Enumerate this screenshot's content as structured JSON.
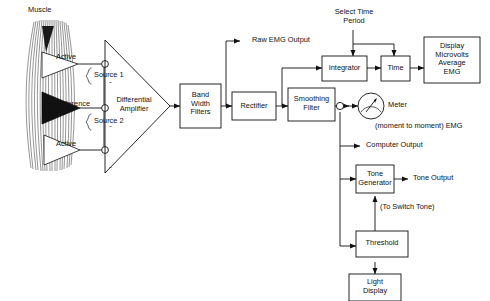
{
  "diagram": {
    "type": "block-flow-diagram",
    "background": "#ffffff",
    "line_color": "#111111"
  },
  "source": {
    "muscle_label": "Muscle",
    "electrodes": [
      {
        "id": "active-top",
        "label": "Active",
        "fill": "white"
      },
      {
        "id": "reference",
        "label": "Reference",
        "fill": "black"
      },
      {
        "id": "active-bottom",
        "label": "Active",
        "fill": "white"
      }
    ],
    "sources": [
      {
        "label": "Source 1"
      },
      {
        "label": "Source 2"
      }
    ]
  },
  "amplifier": {
    "label_line1": "Differential",
    "label_line2": "Amplifier",
    "input_signs": [
      "-",
      "-",
      "-"
    ]
  },
  "blocks": [
    {
      "id": "band-width-filters",
      "lines": [
        "Band",
        "Width",
        "Filters"
      ]
    },
    {
      "id": "rectifier",
      "lines": [
        "Rectifier"
      ]
    },
    {
      "id": "smoothing-filter",
      "lines": [
        "Smoothing",
        "Filter"
      ]
    },
    {
      "id": "integrator",
      "lines": [
        "Integrator"
      ]
    },
    {
      "id": "time",
      "lines": [
        "Time"
      ]
    },
    {
      "id": "display",
      "lines": [
        "Display",
        "Microvolts",
        "Average",
        "EMG"
      ]
    },
    {
      "id": "tone-generator",
      "lines": [
        "Tone",
        "Generator"
      ]
    },
    {
      "id": "threshold",
      "lines": [
        "Threshold"
      ]
    },
    {
      "id": "light-display",
      "lines": [
        "Light",
        "Display"
      ]
    }
  ],
  "annotations": {
    "raw_emg_output": "Raw EMG Output",
    "select_time_period_line1": "Select Time",
    "select_time_period_line2": "Period",
    "meter": "Meter",
    "meter_sub": "(moment to moment) EMG",
    "computer_output": "Computer Output",
    "tone_output": "Tone Output",
    "to_switch_tone": "(To Switch Tone)"
  }
}
